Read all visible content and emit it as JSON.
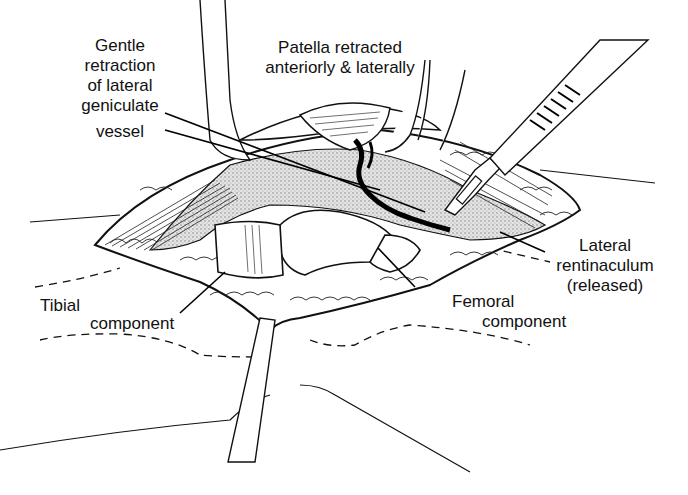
{
  "figure": {
    "type": "surgical-illustration",
    "labels": {
      "vessel": {
        "lines": [
          "Gentle",
          "retraction",
          "of lateral",
          "geniculate",
          "vessel"
        ]
      },
      "patella": {
        "lines": [
          "Patella retracted",
          "anteriorly & laterally"
        ]
      },
      "retinaculum": {
        "lines": [
          "Lateral",
          "rentinaculum",
          "(released)"
        ]
      },
      "tibial": {
        "word1": "Tibial",
        "word2": "component"
      },
      "femoral": {
        "lines": [
          "Femoral",
          "component"
        ]
      }
    },
    "colors": {
      "ink": "#111111",
      "background": "#ffffff",
      "stipple": "#9a9a9a"
    }
  }
}
